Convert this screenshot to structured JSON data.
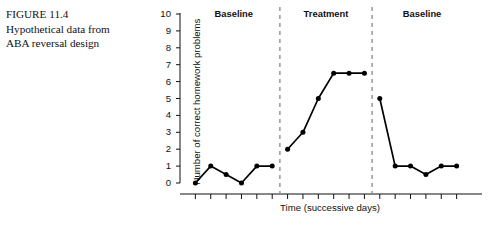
{
  "figure": {
    "number_label": "FIGURE 11.4",
    "caption_line_1": "Hypothetical data from",
    "caption_line_2": "ABA reversal design"
  },
  "chart_data": {
    "type": "line",
    "title": "",
    "subtitle": "",
    "xlabel": "Time (successive days)",
    "ylabel": "Number of correct homework problems",
    "ylim": [
      0,
      10
    ],
    "xlim": [
      0,
      19
    ],
    "ytick_labels": [
      "0",
      "1",
      "2",
      "3",
      "4",
      "5",
      "6",
      "7",
      "8",
      "9",
      "10"
    ],
    "ytick_values": [
      0,
      1,
      2,
      3,
      4,
      5,
      6,
      7,
      8,
      9,
      10
    ],
    "xtick_labels": [],
    "grid": false,
    "legend": "none",
    "marker": "filled-circle",
    "line_color": "#000000",
    "marker_color": "#000000",
    "phase_divider_style": "dashed",
    "phase_divider_color": "#888888",
    "phases": [
      {
        "label": "Baseline",
        "x_start": 0.5,
        "x_end": 6.5,
        "values": [
          0,
          1,
          0.5,
          0,
          1,
          1
        ],
        "x": [
          1,
          2,
          3,
          4,
          5,
          6
        ]
      },
      {
        "label": "Treatment",
        "x_start": 6.5,
        "x_end": 12.5,
        "values": [
          2,
          3,
          5,
          6.5,
          6.5,
          6.5
        ],
        "x": [
          7,
          8,
          9,
          10,
          11,
          12
        ]
      },
      {
        "label": "Baseline",
        "x_start": 12.5,
        "x_end": 19,
        "values": [
          5,
          1,
          1,
          0.5,
          1,
          1
        ],
        "x": [
          13,
          14,
          15,
          16,
          17,
          18
        ]
      }
    ],
    "phase_dividers": [
      6.5,
      12.5
    ],
    "series": [
      {
        "name": "Correct homework problems",
        "x": [
          1,
          2,
          3,
          4,
          5,
          6,
          7,
          8,
          9,
          10,
          11,
          12,
          13,
          14,
          15,
          16,
          17,
          18
        ],
        "values": [
          0,
          1,
          0.5,
          0,
          1,
          1,
          2,
          3,
          5,
          6.5,
          6.5,
          6.5,
          5,
          1,
          1,
          0.5,
          1,
          1
        ]
      }
    ]
  }
}
